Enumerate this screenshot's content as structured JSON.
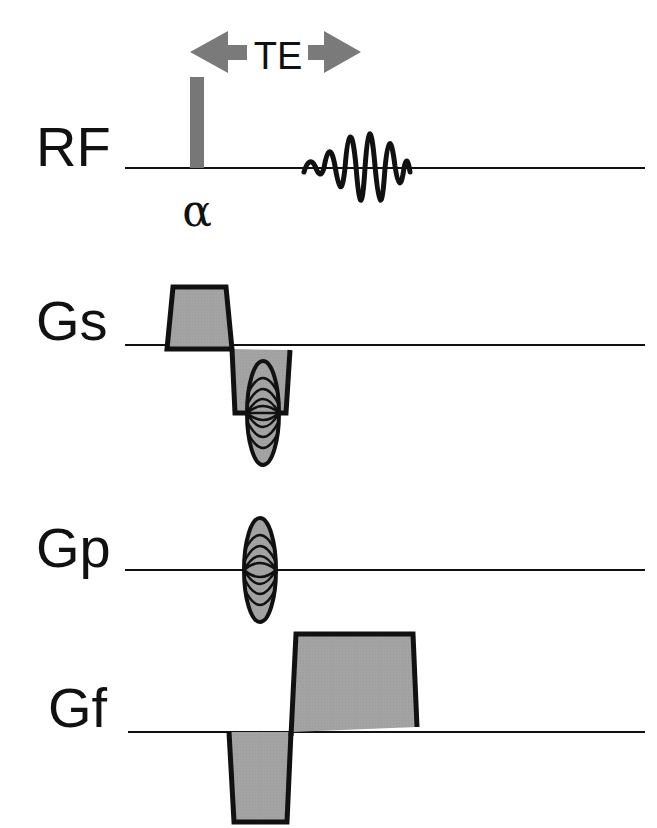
{
  "colors": {
    "line": "#111111",
    "fill": "#a0a0a0",
    "arrow": "#7a7a7a",
    "pulse": "#777777"
  },
  "timing": {
    "arrow_label": "TE"
  },
  "channels": [
    {
      "id": "rf",
      "label": "RF",
      "baseline_y": 168,
      "pulse_label": "α"
    },
    {
      "id": "gs",
      "label": "Gs",
      "baseline_y": 345
    },
    {
      "id": "gp",
      "label": "Gp",
      "baseline_y": 570
    },
    {
      "id": "gf",
      "label": "Gf",
      "baseline_y": 732
    }
  ]
}
